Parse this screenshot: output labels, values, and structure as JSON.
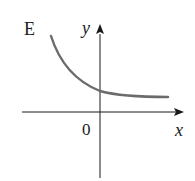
{
  "figure": {
    "panel_label": "E",
    "x_axis_label": "x",
    "y_axis_label": "y",
    "origin_label": "0",
    "colors": {
      "axes": "#1a1a1a",
      "curve": "#6b6b6b",
      "background": "#ffffff"
    },
    "curve": {
      "description": "decreasing convex curve approaching a positive horizontal asymptote, crossing the positive y-axis",
      "type": "exponential-decay-plus-constant"
    }
  }
}
